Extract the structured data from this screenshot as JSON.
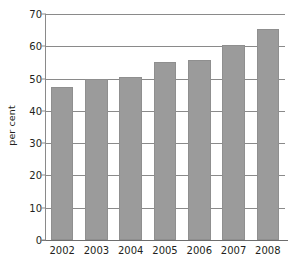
{
  "chart_data": {
    "type": "bar",
    "title": "",
    "subtitle": "",
    "xlabel": "",
    "ylabel": "per cent",
    "categories": [
      "2002",
      "2003",
      "2004",
      "2005",
      "2006",
      "2007",
      "2008"
    ],
    "values": [
      47.5,
      49.8,
      50.5,
      55.0,
      55.8,
      60.3,
      65.3
    ],
    "series": [
      {
        "name": "per cent",
        "values": [
          47.5,
          49.8,
          50.5,
          55.0,
          55.8,
          60.3,
          65.3
        ]
      }
    ],
    "ylim": [
      0,
      70
    ],
    "yticks": [
      0,
      10,
      20,
      30,
      40,
      50,
      60,
      70
    ],
    "ytick_labels": [
      "0",
      "10",
      "20",
      "30",
      "40",
      "50",
      "60",
      "70"
    ],
    "xtick_labels": [
      "2002",
      "2003",
      "2004",
      "2005",
      "2006",
      "2007",
      "2008"
    ],
    "grid": true,
    "grid_axis": "y",
    "legend": false,
    "legend_position": "none",
    "bar_color": "#9b9b9b",
    "bar_edge_color": "#8f8f8f",
    "axis_color": "#8a8a8a",
    "text_color": "#231f20",
    "background_color": "#ffffff",
    "annotations": []
  },
  "figure": {
    "caption_strip": ""
  }
}
